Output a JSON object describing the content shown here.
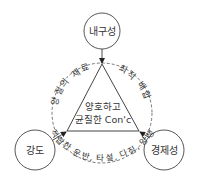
{
  "diagram": {
    "center_label_line1": "양호하고",
    "center_label_line2": "균질한 Con'c",
    "nodes": {
      "top": "내구성",
      "left": "강도",
      "right": "경제성"
    },
    "arc_labels": {
      "left": "양질의 재료",
      "right": "최적 배합",
      "bottom": "적합한 운반, 타설, 다짐, 양생"
    },
    "colors": {
      "stroke": "#444444",
      "text": "#333333",
      "background": "#ffffff"
    }
  }
}
